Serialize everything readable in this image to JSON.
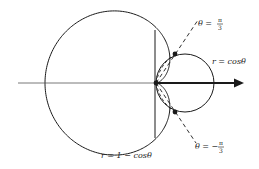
{
  "diagram": {
    "type": "polar-curves",
    "origin": {
      "x": 156,
      "y": 83
    },
    "scale": 58,
    "colors": {
      "stroke": "#1a1a1a",
      "background": "#ffffff"
    },
    "curves": [
      {
        "id": "cardioid",
        "equation": "r = 1 − cosθ",
        "label": "r = 1 − cosθ"
      },
      {
        "id": "circle",
        "equation": "r = cosθ",
        "label": "r = cosθ"
      }
    ],
    "rays": [
      {
        "id": "ray-upper",
        "angle_label": "θ = π/3",
        "theta_prefix": "θ =",
        "num": "π",
        "den": "3"
      },
      {
        "id": "ray-lower",
        "angle_label": "θ = −π/3",
        "theta_prefix": "θ = −",
        "num": "π",
        "den": "3"
      }
    ],
    "intersection_points": [
      {
        "theta": "π/3",
        "r": "1/2"
      },
      {
        "theta": "−π/3",
        "r": "1/2"
      },
      {
        "theta": "origin",
        "r": "0"
      }
    ],
    "axis": {
      "label": "polar axis",
      "arrow": true
    }
  },
  "labels": {
    "circle": "r = cosθ",
    "cardioid": "r = 1 − cosθ",
    "upper_prefix": "θ =",
    "lower_prefix": "θ = −",
    "pi": "π",
    "three": "3"
  }
}
